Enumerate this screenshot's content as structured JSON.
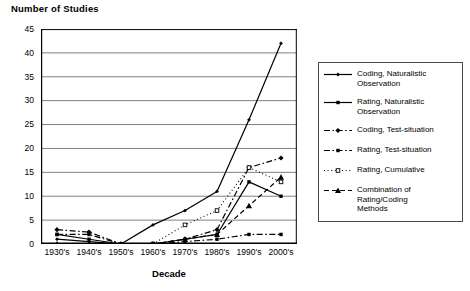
{
  "chart_data": {
    "type": "line",
    "title": "Number of Studies",
    "xlabel": "Decade",
    "ylabel": "",
    "categories": [
      "1930's",
      "1940's",
      "1950's",
      "1960's",
      "1970's",
      "1980's",
      "1990's",
      "2000's"
    ],
    "yticks": [
      0,
      5,
      10,
      15,
      20,
      25,
      30,
      35,
      40,
      45
    ],
    "ylim": [
      0,
      45
    ],
    "grid": true,
    "legend_position": "right",
    "series": [
      {
        "name": "Coding, Naturalistic Observation",
        "line": "solid",
        "marker": "diamond-small",
        "color": "#000000",
        "values": [
          1,
          0.5,
          0,
          4,
          7,
          11,
          26,
          42
        ]
      },
      {
        "name": "Rating, Naturalistic Observation",
        "line": "solid",
        "marker": "square",
        "color": "#000000",
        "values": [
          2,
          1,
          0,
          0,
          1,
          2,
          13,
          10
        ]
      },
      {
        "name": "Coding, Test-situation",
        "line": "dash-dot",
        "marker": "diamond",
        "color": "#000000",
        "values": [
          3,
          2.5,
          0,
          0,
          1,
          3,
          16,
          18
        ]
      },
      {
        "name": "Rating, Test-situation",
        "line": "dash-dot",
        "marker": "square",
        "color": "#000000",
        "values": [
          2,
          2,
          0,
          0,
          0.5,
          1,
          2,
          2
        ]
      },
      {
        "name": "Rating, Cumulative",
        "line": "dotted",
        "marker": "square-open",
        "color": "#000000",
        "values": [
          null,
          null,
          null,
          0,
          4,
          7,
          16,
          13
        ]
      },
      {
        "name": "Combination of Rating/Coding\nMethods",
        "line": "dashed",
        "marker": "triangle",
        "color": "#000000",
        "values": [
          0,
          0,
          0,
          0,
          1,
          2,
          8,
          14
        ]
      }
    ]
  },
  "legend": {
    "entries": [
      "Coding, Naturalistic Observation",
      "Rating, Naturalistic Observation",
      "Coding, Test-situation",
      "Rating, Test-situation",
      "Rating, Cumulative",
      "Combination of Rating/Coding\nMethods"
    ]
  },
  "colors": {
    "axis": "#000000",
    "grid": "#808080",
    "legend_border": "#4a4a4a",
    "background": "#ffffff"
  }
}
